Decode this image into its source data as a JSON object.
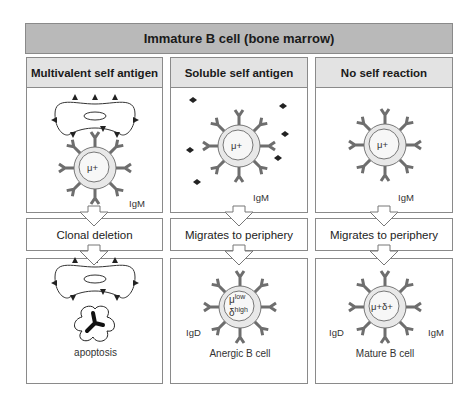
{
  "title": "Immature B cell (bone marrow)",
  "columns": [
    {
      "header": "Multivalent self antigen",
      "top": {
        "cell_marker": "μ+",
        "receptor_label": "IgM",
        "antigen": "multivalent self antigen on cell surface"
      },
      "outcome": "Clonal deletion",
      "bottom": {
        "caption": "apoptosis"
      }
    },
    {
      "header": "Soluble self antigen",
      "top": {
        "cell_marker": "μ+",
        "receptor_label": "IgM",
        "antigen": "soluble self antigen"
      },
      "outcome": "Migrates to periphery",
      "bottom": {
        "caption": "Anergic B cell",
        "cell_marker_mu": "μ",
        "mu_sup": "low",
        "cell_marker_delta": "δ",
        "delta_sup": "high",
        "receptor_label": "IgD"
      }
    },
    {
      "header": "No self reaction",
      "top": {
        "cell_marker": "μ+",
        "receptor_label": "IgM"
      },
      "outcome": "Migrates to periphery",
      "bottom": {
        "caption": "Mature B cell",
        "cell_marker": "μ+δ+",
        "receptor_left": "IgD",
        "receptor_right": "IgM"
      }
    }
  ],
  "colors": {
    "title_bg": "#b9b9b9",
    "header_bg": "#e3e3e3",
    "border": "#8a8a8a",
    "receptor": "#6e6e6e",
    "cell_fill": "#e6e6e6"
  }
}
